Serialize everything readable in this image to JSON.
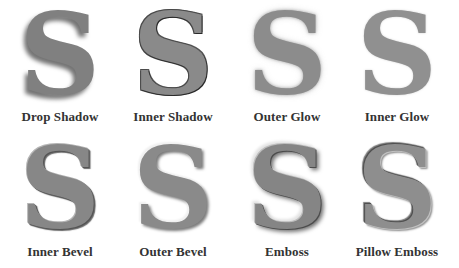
{
  "glyph": "S",
  "effects": [
    {
      "id": "drop-shadow",
      "label": "Drop Shadow"
    },
    {
      "id": "inner-shadow",
      "label": "Inner Shadow"
    },
    {
      "id": "outer-glow",
      "label": "Outer Glow"
    },
    {
      "id": "inner-glow",
      "label": "Inner Glow"
    },
    {
      "id": "inner-bevel",
      "label": "Inner Bevel"
    },
    {
      "id": "outer-bevel",
      "label": "Outer Bevel"
    },
    {
      "id": "emboss",
      "label": "Emboss"
    },
    {
      "id": "pillow-emboss",
      "label": "Pillow Emboss"
    }
  ],
  "colors": {
    "background": "#ffffff",
    "glyph_fill": "#858585",
    "label_text": "#333333"
  }
}
